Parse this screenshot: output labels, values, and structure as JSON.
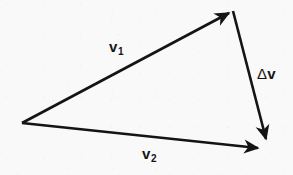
{
  "figure": {
    "kind": "vector-triangle-diagram",
    "width": 293,
    "height": 175,
    "background_color": "#f9f9f9",
    "ink_color": "#141414",
    "stroke_width": 2.6,
    "labels": {
      "v1": {
        "base": "v",
        "subscript": "1"
      },
      "v2": {
        "base": "v",
        "subscript": "2"
      },
      "delta_v": {
        "symbol": "Δ",
        "base": "v"
      }
    },
    "vectors": [
      {
        "name": "v1",
        "label": "v1",
        "from": {
          "x": 22,
          "y": 123
        },
        "to": {
          "x": 233,
          "y": 11
        },
        "arrowhead": "filled-triangle",
        "label_position": {
          "x": 109,
          "y": 39
        }
      },
      {
        "name": "v2",
        "label": "v2",
        "from": {
          "x": 22,
          "y": 123
        },
        "to": {
          "x": 263,
          "y": 149
        },
        "arrowhead": "filled-triangle",
        "label_position": {
          "x": 142,
          "y": 146
        }
      },
      {
        "name": "delta_v",
        "label": "delta_v",
        "from": {
          "x": 233,
          "y": 11
        },
        "to": {
          "x": 268,
          "y": 146
        },
        "arrowhead": "filled-triangle",
        "label_position": {
          "x": 257,
          "y": 66
        }
      }
    ],
    "vertices": [
      {
        "name": "origin-vertex",
        "x": 22,
        "y": 123
      },
      {
        "name": "apex-vertex",
        "x": 233,
        "y": 11
      },
      {
        "name": "lower-right-vertex",
        "x": 264,
        "y": 148
      }
    ]
  }
}
